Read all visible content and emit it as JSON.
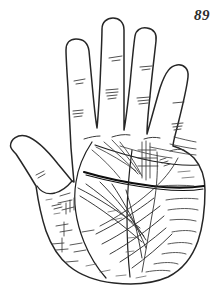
{
  "plate": {
    "number": "89",
    "caption": "89",
    "subject": "palm print line drawing",
    "hand": "left hand, palmar surface",
    "background_color": "#ffffff",
    "ink_color": "#262626",
    "light_ink_color": "#555555",
    "heavy_ink_color": "#111111"
  },
  "figure": {
    "title": "89",
    "type": "palmistry-hand-diagram",
    "outline_label": "hand-outline",
    "digits": [
      {
        "name": "thumb",
        "label": "thumb",
        "tip_x": 22,
        "tip_y": 147,
        "creases": 3
      },
      {
        "name": "index-finger",
        "label": "index finger",
        "tip_x": 80,
        "tip_y": 41,
        "creases": 2
      },
      {
        "name": "middle-finger",
        "label": "middle finger",
        "tip_x": 115,
        "tip_y": 20,
        "creases": 3
      },
      {
        "name": "ring-finger",
        "label": "ring finger",
        "tip_x": 146,
        "tip_y": 30,
        "creases": 3
      },
      {
        "name": "little-finger",
        "label": "little finger",
        "tip_x": 189,
        "tip_y": 66,
        "creases": 2
      }
    ],
    "major_lines": [
      {
        "name": "heart-line",
        "label": "heart line",
        "weight": "medium"
      },
      {
        "name": "head-line",
        "label": "head line",
        "weight": "heavy"
      },
      {
        "name": "life-line",
        "label": "life line",
        "weight": "medium"
      },
      {
        "name": "fate-line",
        "label": "fate line",
        "weight": "medium"
      },
      {
        "name": "sun-line",
        "label": "sun line",
        "weight": "light"
      },
      {
        "name": "mercury-line",
        "label": "mercury line",
        "weight": "light"
      }
    ],
    "minor_line_count": 46
  }
}
